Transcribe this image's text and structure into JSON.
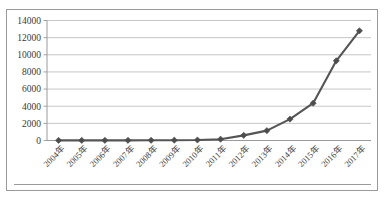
{
  "chart_data": {
    "type": "line",
    "title": "",
    "title_visible": false,
    "title_note": "cropped at top edge of screenshot, illegible",
    "xlabel": "",
    "ylabel": "",
    "categories": [
      "2004年",
      "2005年",
      "2006年",
      "2007年",
      "2008年",
      "2009年",
      "2010年",
      "2011年",
      "2012年",
      "2013年",
      "2014年",
      "2015年",
      "2016年",
      "2017年"
    ],
    "values": [
      10,
      12,
      15,
      20,
      25,
      35,
      60,
      150,
      600,
      1150,
      2500,
      4350,
      9300,
      12800
    ],
    "series": [
      {
        "name": "",
        "values": [
          10,
          12,
          15,
          20,
          25,
          35,
          60,
          150,
          600,
          1150,
          2500,
          4350,
          9300,
          12800
        ]
      }
    ],
    "ylim": [
      0,
      14000
    ],
    "yticks": [
      0,
      2000,
      4000,
      6000,
      8000,
      10000,
      12000,
      14000
    ],
    "ytick_labels": [
      "0",
      "2000",
      "4000",
      "6000",
      "8000",
      "10000",
      "12000",
      "14000"
    ],
    "grid": true,
    "grid_axis": "y",
    "legend": false,
    "legend_position": "none",
    "marker": "diamond",
    "xtick_rotation": 45,
    "colors": {
      "series": "#555555",
      "marker": "#4d4d4d",
      "gridline": "#c0c0c0",
      "axis": "#9a9a9a",
      "frame": "#9a9a9a",
      "background": "#ffffff",
      "tick_text": "#3a3a3a"
    }
  }
}
